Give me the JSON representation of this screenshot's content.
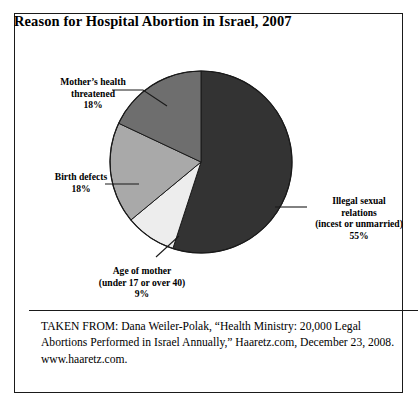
{
  "figure": {
    "title": "Reason for Hospital Abortion in Israel, 2007",
    "caption": "TAKEN FROM: Dana Weiler-Polak, “Health Ministry: 20,000 Legal Abortions Performed in Israel Annually,” Haaretz.com, December 23, 2008. www.haaretz.com."
  },
  "labels": {
    "mothers_health": "Mother’s health\nthreatened\n18%",
    "birth_defects": "Birth defects\n18%",
    "age_of_mother": "Age of mother\n(under 17 or over 40)\n9%",
    "illegal_sexual": "Illegal sexual\nrelations\n(incest or unmarried)\n55%"
  },
  "colors": {
    "illegal_sexual": "#333333",
    "age_of_mother": "#ededed",
    "birth_defects": "#a9a9a9",
    "mothers_health": "#6e6e6e",
    "outline": "#1a1a1a",
    "leader_line": "#1a1a1a",
    "background": "#ffffff"
  },
  "chart_data": {
    "type": "pie",
    "title": "Reason for Hospital Abortion in Israel, 2007",
    "xlabel": "",
    "ylabel": "",
    "unit": "percent",
    "start_angle_deg": 0,
    "direction": "clockwise",
    "legend": "none (direct labels with leader lines)",
    "grid": false,
    "categories": [
      "Illegal sexual relations (incest or unmarried)",
      "Age of mother (under 17 or over 40)",
      "Birth defects",
      "Mother’s health threatened"
    ],
    "values": [
      55,
      9,
      18,
      18
    ],
    "slices": [
      {
        "label": "Illegal sexual relations (incest or unmarried)",
        "value": 55,
        "color": "#333333"
      },
      {
        "label": "Age of mother (under 17 or over 40)",
        "value": 9,
        "color": "#ededed"
      },
      {
        "label": "Birth defects",
        "value": 18,
        "color": "#a9a9a9"
      },
      {
        "label": "Mother’s health threatened",
        "value": 18,
        "color": "#6e6e6e"
      }
    ]
  }
}
